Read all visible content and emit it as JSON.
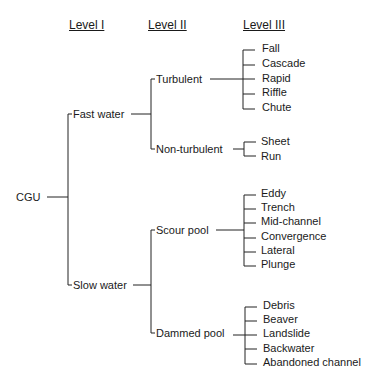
{
  "headers": {
    "level1": "Level I",
    "level2": "Level II",
    "level3": "Level III"
  },
  "root": {
    "label": "CGU"
  },
  "level1": {
    "fast": "Fast water",
    "slow": "Slow water"
  },
  "level2": {
    "turbulent": "Turbulent",
    "nonturbulent": "Non-turbulent",
    "scour": "Scour pool",
    "dammed": "Dammed pool"
  },
  "level3": {
    "turbulent": [
      "Fall",
      "Cascade",
      "Rapid",
      "Riffle",
      "Chute"
    ],
    "nonturbulent": [
      "Sheet",
      "Run"
    ],
    "scour": [
      "Eddy",
      "Trench",
      "Mid-channel",
      "Convergence",
      "Lateral",
      "Plunge"
    ],
    "dammed": [
      "Debris",
      "Beaver",
      "Landslide",
      "Backwater",
      "Abandoned channel"
    ]
  },
  "colors": {
    "line": "#222222",
    "text": "#1a1a1a"
  }
}
